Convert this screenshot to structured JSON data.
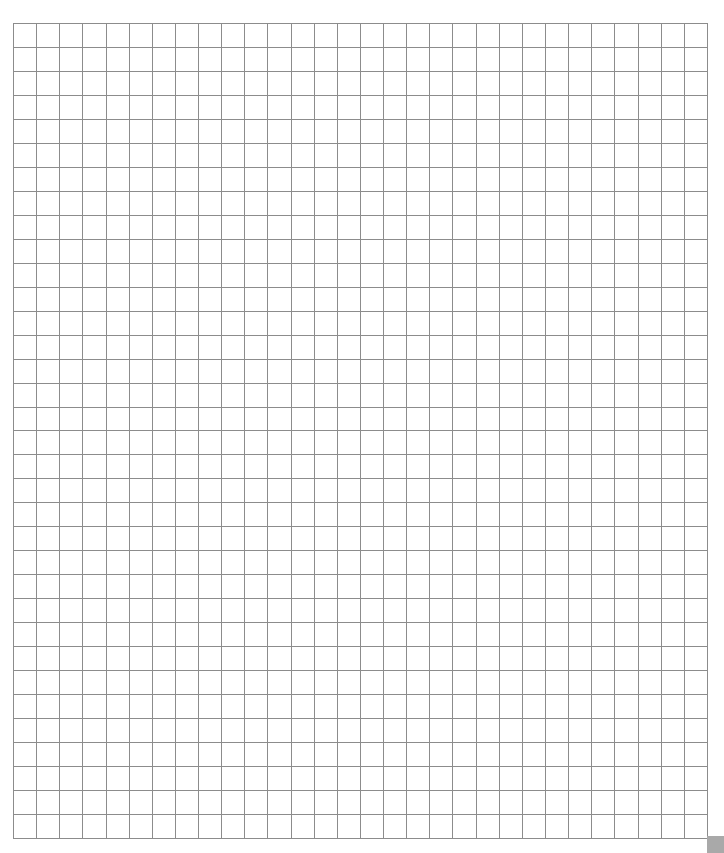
{
  "document": {
    "type": "grid-paper",
    "background_color": "#ffffff"
  },
  "grid": {
    "origin_x": 13,
    "origin_y": 23,
    "columns": 30,
    "rows": 34,
    "cell_width": 23.13,
    "cell_height": 23.97,
    "line_color": "#8c8c8c",
    "line_width": 1
  },
  "corner_handle": {
    "icon": "resize-corner-icon",
    "color": "#a9a9a9"
  }
}
